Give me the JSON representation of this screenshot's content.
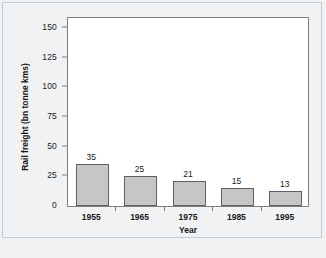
{
  "chart_data": {
    "type": "bar",
    "title": "",
    "categories": [
      "1955",
      "1965",
      "1975",
      "1985",
      "1995"
    ],
    "values": [
      35,
      25,
      21,
      15,
      13
    ],
    "xlabel": "Year",
    "ylabel": "Rail freight (bn tonne kms)",
    "ylim": [
      0,
      160
    ],
    "yticks": [
      0,
      25,
      50,
      75,
      100,
      125,
      150
    ],
    "ytick_labels": [
      "0",
      "25",
      "50",
      "75",
      "100",
      "125",
      "150"
    ],
    "grid": false,
    "legend": false,
    "bar_color": "#c6c6c6",
    "bar_edge_color": "#5d6066",
    "data_labels": [
      "35",
      "25",
      "21",
      "15",
      "13"
    ]
  },
  "figure": {
    "frame_color": "#c4ccd6",
    "background": "#f1f2f4",
    "plot_background": "#ffffff",
    "axis_color": "#7b7f86"
  },
  "caption": {
    "text": ""
  }
}
